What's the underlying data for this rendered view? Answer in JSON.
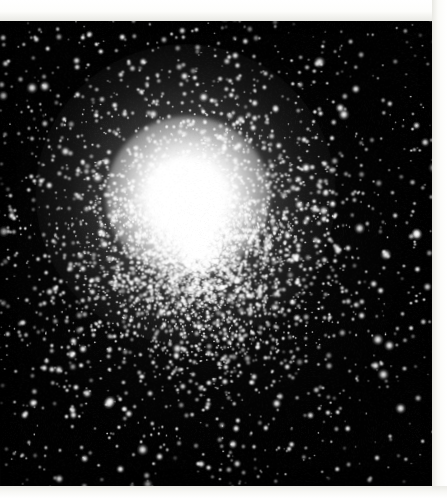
{
  "image": {
    "kind": "astronomical-photograph",
    "subject": "globular-star-cluster",
    "medium": "black-and-white photographic print",
    "orientation_tilt_degrees": -0.55,
    "visible_text": [],
    "caption": ""
  },
  "plate": {
    "width": 447,
    "height": 498,
    "paper_color": "#fbfbf8",
    "sky_color": "#010101",
    "star_color": "#ffffff"
  },
  "sky_region": {
    "left": -4,
    "top": 18,
    "width": 440,
    "height": 472,
    "background_hex": "#010101"
  },
  "margins": {
    "top_height": 21,
    "right_width": 15,
    "bottom_height": 12,
    "left_width": 0,
    "color_hex": "#ffffff"
  },
  "cluster": {
    "center_x": 195,
    "center_y": 250,
    "saturated_core_radius": 44,
    "bright_core_radius": 82,
    "halo_radius": 150,
    "core_color_hex": "#ffffff",
    "halo_falloff": "radial"
  },
  "starfield": {
    "seed": 20240517,
    "cluster_star_count": 5200,
    "halo_star_count": 1600,
    "field_star_count": 560,
    "bright_field_star_count": 120,
    "min_radius_px": 0.4,
    "max_radius_px": 2.6,
    "cluster_sigma_px": 78,
    "halo_sigma_px": 132
  },
  "chart_data": {
    "type": "scatter",
    "title": "",
    "xlabel": "",
    "ylabel": "",
    "x": [
      0,
      10,
      20,
      30,
      40,
      50,
      60,
      70,
      80,
      90,
      100,
      115,
      130,
      150,
      175,
      200,
      225
    ],
    "values": [
      1.0,
      1.0,
      1.0,
      0.99,
      0.97,
      0.9,
      0.78,
      0.63,
      0.48,
      0.36,
      0.27,
      0.17,
      0.11,
      0.06,
      0.03,
      0.015,
      0.008
    ],
    "xlim": [
      0,
      225
    ],
    "ylim": [
      0,
      1
    ],
    "grid": false,
    "legend": "none"
  }
}
